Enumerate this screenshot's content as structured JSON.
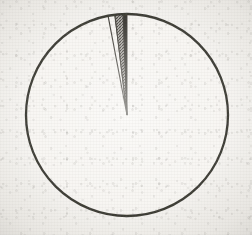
{
  "figure": {
    "kind": "pie-chart",
    "title": "",
    "subtitle": "",
    "caption": "",
    "background_color": "#f4f2ee",
    "ink_color": "#17150f",
    "render_style": "photocopied scan, grainy off-white paper, no labels or legend"
  },
  "geometry": {
    "center_x": 127,
    "center_y": 115,
    "radius": 101,
    "outline_width": 2.3,
    "start_angle_deg": 0,
    "direction": "clockwise from 12 o'clock"
  },
  "chart_data": {
    "type": "pie",
    "title": "",
    "xlabel": "",
    "ylabel": "",
    "legend": "none",
    "grid": false,
    "labels_shown": false,
    "total_degrees": 360,
    "categories": [
      "Slice A",
      "Slice B",
      "Slice C",
      "Slice D"
    ],
    "values": [
      97.0,
      0.6,
      1.3,
      1.1
    ],
    "units": "percent",
    "angles_deg": [
      349.2,
      2.2,
      4.7,
      3.9
    ],
    "colors": [
      "#f6f4f0",
      "#17150f",
      "#6e6b64",
      "#f6f4f0"
    ],
    "fills": [
      "solid",
      "solid",
      "hatch",
      "solid"
    ],
    "slices": [
      {
        "name": "Slice A",
        "value": 97.0,
        "angle_deg": 349.2,
        "start_deg": 10.8,
        "end_deg": 360.0,
        "color": "#f6f4f0",
        "fill": "solid",
        "note": "dominant slice, unfilled white"
      },
      {
        "name": "Slice B",
        "value": 0.6,
        "angle_deg": 2.2,
        "start_deg": 357.8,
        "end_deg": 360.0,
        "color": "#17150f",
        "fill": "solid",
        "note": "solid black sliver adjacent to 12 o'clock"
      },
      {
        "name": "Slice C",
        "value": 1.3,
        "angle_deg": 4.7,
        "start_deg": 353.1,
        "end_deg": 357.8,
        "color": "#6e6b64",
        "fill": "hatch",
        "note": "mid-gray cross-hatched sliver"
      },
      {
        "name": "Slice D",
        "value": 1.1,
        "angle_deg": 3.9,
        "start_deg": 349.2,
        "end_deg": 353.1,
        "color": "#f6f4f0",
        "fill": "solid",
        "note": "white sliver bounded by thin rules"
      }
    ]
  }
}
